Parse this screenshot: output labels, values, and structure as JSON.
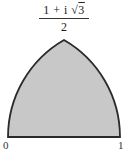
{
  "diagram": {
    "apex_label": {
      "numerator_prefix": "1 + i ",
      "radical": "√",
      "radicand": "3",
      "denominator": "2"
    },
    "left_label": "0",
    "right_label": "1",
    "region": {
      "fill": "#c8c8c8",
      "stroke": "#2a2a2a",
      "description": "Reuleaux-triangle-shaped region bounded by the segment [0,1] and two unit circular arcs meeting at (1+i√3)/2"
    }
  }
}
